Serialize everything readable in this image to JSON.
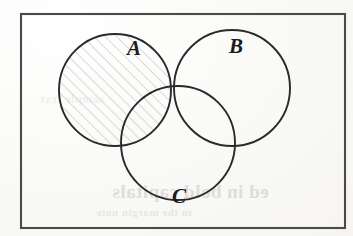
{
  "figure": {
    "type": "venn-diagram",
    "background_color": "#fbfbf9",
    "ink_color": "#2a2a2a",
    "hatch_color": "#b9b9b9"
  },
  "universe": {
    "name": "universal-set-rectangle",
    "border_color": "#4a4a4a",
    "x": 21,
    "y": 14,
    "width": 324,
    "height": 214
  },
  "sets": [
    {
      "id": "A",
      "label": "A",
      "cx": 115,
      "cy": 90,
      "r": 56,
      "shaded": true,
      "label_x": 127,
      "label_y": 38
    },
    {
      "id": "B",
      "label": "B",
      "cx": 232,
      "cy": 88,
      "r": 58,
      "shaded": false,
      "label_x": 229,
      "label_y": 36
    },
    {
      "id": "C",
      "label": "C",
      "cx": 178,
      "cy": 143,
      "r": 57,
      "shaded": false,
      "label_x": 172,
      "label_y": 186
    }
  ],
  "shading": {
    "region_label": "A",
    "pattern": "diagonal-hatch",
    "angle_degrees": 45,
    "spacing_px": 8,
    "color": "#b9b9b9"
  },
  "show_through": {
    "line_1": "ed in bold capitals",
    "line_2": "in the margin note",
    "line_3": "sample text"
  }
}
